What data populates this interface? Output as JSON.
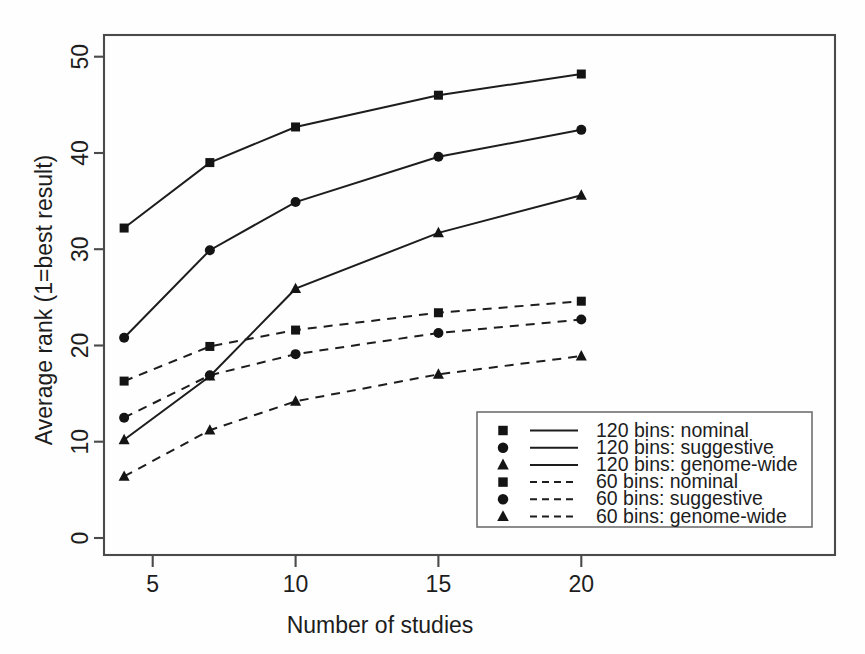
{
  "chart_data": {
    "type": "line",
    "title": "",
    "xlabel": "Number of studies",
    "ylabel": "Average rank (1=best result)",
    "x": [
      4,
      7,
      10,
      15,
      20
    ],
    "xlim": [
      3.3,
      21.0
    ],
    "ylim": [
      -1.5,
      52.5
    ],
    "xticks": [
      5,
      10,
      15,
      20
    ],
    "xticklabels": [
      "5",
      "10",
      "15",
      "20"
    ],
    "yticks": [
      0,
      10,
      20,
      30,
      40,
      50
    ],
    "yticklabels": [
      "0",
      "10",
      "20",
      "30",
      "40",
      "50"
    ],
    "grid": false,
    "legend_position": "lower right",
    "series": [
      {
        "name": "120 bins: nominal",
        "marker": "square",
        "linestyle": "solid",
        "color": "#1d1d1d",
        "values": [
          32.2,
          39.0,
          42.7,
          46.0,
          48.2
        ]
      },
      {
        "name": "120 bins: suggestive",
        "marker": "circle",
        "linestyle": "solid",
        "color": "#1d1d1d",
        "values": [
          20.8,
          29.9,
          34.9,
          39.6,
          42.4
        ]
      },
      {
        "name": "120 bins: genome-wide",
        "marker": "triangle",
        "linestyle": "solid",
        "color": "#1d1d1d",
        "values": [
          10.2,
          16.8,
          25.9,
          31.7,
          35.6
        ]
      },
      {
        "name": "60 bins: nominal",
        "marker": "square",
        "linestyle": "dashed",
        "color": "#1d1d1d",
        "values": [
          16.3,
          19.9,
          21.6,
          23.4,
          24.6
        ]
      },
      {
        "name": "60 bins: suggestive",
        "marker": "circle",
        "linestyle": "dashed",
        "color": "#1d1d1d",
        "values": [
          12.5,
          16.9,
          19.1,
          21.3,
          22.7
        ]
      },
      {
        "name": "60 bins: genome-wide",
        "marker": "triangle",
        "linestyle": "dashed",
        "color": "#1d1d1d",
        "values": [
          6.4,
          11.2,
          14.2,
          17.0,
          18.9
        ]
      }
    ]
  },
  "axes": {
    "x_title": "Number of studies",
    "y_title": "Average rank (1=best result)",
    "x_tick_labels": [
      "5",
      "10",
      "15",
      "20"
    ],
    "y_tick_labels": [
      "0",
      "10",
      "20",
      "30",
      "40",
      "50"
    ]
  },
  "legend": {
    "entries": [
      {
        "label": "120 bins: nominal",
        "marker": "square-marker-icon",
        "line": "solid"
      },
      {
        "label": "120 bins: suggestive",
        "marker": "circle-marker-icon",
        "line": "solid"
      },
      {
        "label": "120 bins: genome-wide",
        "marker": "triangle-marker-icon",
        "line": "solid"
      },
      {
        "label": "60 bins: nominal",
        "marker": "square-marker-icon",
        "line": "dashed"
      },
      {
        "label": "60 bins: suggestive",
        "marker": "circle-marker-icon",
        "line": "dashed"
      },
      {
        "label": "60 bins: genome-wide",
        "marker": "triangle-marker-icon",
        "line": "dashed"
      }
    ]
  },
  "colors": {
    "ink": "#1d1d1d",
    "frame": "#4a4a4a",
    "background": "#fefefe"
  }
}
